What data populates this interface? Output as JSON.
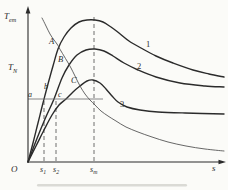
{
  "figure": {
    "bg": "#fbfbf8",
    "ink": "#2b2b2b",
    "labels": {
      "y_axis": {
        "main": "T",
        "sub": "em"
      },
      "y_ref": {
        "main": "T",
        "sub": "N"
      },
      "origin": "O",
      "x_axis": "s",
      "tick1": {
        "main": "s",
        "sub": "1"
      },
      "tick2": {
        "main": "s",
        "sub": "2"
      },
      "tick_m": {
        "main": "s",
        "sub": "m"
      },
      "curve1": "1",
      "curve2": "2",
      "curve3": "3",
      "point_A": "A",
      "point_B": "B",
      "point_C": "C",
      "point_a": "a",
      "point_b": "b",
      "point_c": "c"
    }
  },
  "chart_data": {
    "type": "line",
    "title": "",
    "xlabel": "s",
    "ylabel": "Tem",
    "x_ticks": [
      "s1",
      "s2",
      "sm"
    ],
    "y_reference_level": "TN",
    "curve_labels": [
      "1",
      "2",
      "3"
    ],
    "point_labels": [
      "A",
      "B",
      "C",
      "a",
      "b",
      "c"
    ],
    "grid": false,
    "legend": false,
    "series": [
      {
        "name": "1",
        "class": "curve-thick",
        "smooth": true,
        "points": [
          [
            28,
            162
          ],
          [
            33,
            143
          ],
          [
            38,
            123
          ],
          [
            43,
            103
          ],
          [
            48,
            84
          ],
          [
            53,
            66
          ],
          [
            58,
            49
          ],
          [
            64,
            37
          ],
          [
            71,
            28
          ],
          [
            79,
            22
          ],
          [
            87,
            20
          ],
          [
            95,
            20
          ],
          [
            103,
            22
          ],
          [
            111,
            27
          ],
          [
            119,
            33
          ],
          [
            129,
            41
          ],
          [
            141,
            48
          ],
          [
            156,
            56
          ],
          [
            173,
            63
          ],
          [
            193,
            70
          ],
          [
            209,
            74
          ],
          [
            224,
            77
          ]
        ]
      },
      {
        "name": "2",
        "class": "curve-thick",
        "smooth": true,
        "points": [
          [
            28,
            162
          ],
          [
            36,
            141
          ],
          [
            45,
            119
          ],
          [
            54,
            99
          ],
          [
            62,
            78
          ],
          [
            69,
            65
          ],
          [
            77,
            55
          ],
          [
            86,
            50
          ],
          [
            95,
            49
          ],
          [
            104,
            51
          ],
          [
            113,
            56
          ],
          [
            124,
            63
          ],
          [
            138,
            70
          ],
          [
            156,
            77
          ],
          [
            180,
            83
          ],
          [
            205,
            86
          ],
          [
            224,
            87
          ]
        ]
      },
      {
        "name": "3",
        "class": "curve-thick",
        "smooth": true,
        "points": [
          [
            28,
            162
          ],
          [
            36,
            146
          ],
          [
            44,
            130
          ],
          [
            52,
            115
          ],
          [
            59,
            105
          ],
          [
            66,
            99
          ],
          [
            73,
            92
          ],
          [
            80,
            86
          ],
          [
            87,
            81
          ],
          [
            93,
            80
          ],
          [
            100,
            83
          ],
          [
            106,
            89
          ],
          [
            112,
            96
          ],
          [
            118,
            102
          ],
          [
            127,
            107
          ],
          [
            140,
            110
          ],
          [
            158,
            112
          ],
          [
            185,
            113
          ],
          [
            224,
            114
          ]
        ]
      },
      {
        "name": "load-curve",
        "class": "curve-thin",
        "smooth": true,
        "points": [
          [
            42,
            18
          ],
          [
            46,
            26
          ],
          [
            50,
            34
          ],
          [
            54,
            40
          ],
          [
            57,
            44
          ],
          [
            61,
            51
          ],
          [
            64,
            56
          ],
          [
            67,
            61
          ],
          [
            71,
            68
          ],
          [
            75,
            76
          ],
          [
            80,
            86
          ],
          [
            85,
            94
          ],
          [
            90,
            100
          ],
          [
            95,
            105
          ],
          [
            101,
            111
          ],
          [
            108,
            116
          ],
          [
            116,
            121
          ],
          [
            126,
            127
          ],
          [
            138,
            132
          ],
          [
            152,
            137
          ],
          [
            168,
            142
          ],
          [
            186,
            146
          ],
          [
            205,
            149
          ],
          [
            224,
            151
          ]
        ]
      },
      {
        "name": "TN-level-line",
        "class": "ref-line",
        "smooth": false,
        "points": [
          [
            28,
            99
          ],
          [
            103,
            99
          ]
        ]
      }
    ],
    "guides": [
      {
        "name": "s1-guide",
        "x": 44,
        "y1": 101,
        "y2": 161
      },
      {
        "name": "s2-guide",
        "x": 56,
        "y1": 101,
        "y2": 161
      },
      {
        "name": "sm-guide",
        "x": 94,
        "y1": 17,
        "y2": 161
      }
    ]
  }
}
